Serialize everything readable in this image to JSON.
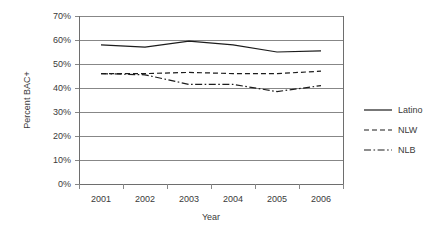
{
  "chart_data": {
    "type": "line",
    "title": "",
    "xlabel": "Year",
    "ylabel": "Percent BAC+",
    "categories": [
      "2001",
      "2002",
      "2003",
      "2004",
      "2005",
      "2006"
    ],
    "x": [
      2001,
      2002,
      2003,
      2004,
      2005,
      2006
    ],
    "ylim": [
      0,
      70
    ],
    "yticks": [
      0,
      10,
      20,
      30,
      40,
      50,
      60,
      70
    ],
    "ytick_labels": [
      "0%",
      "10%",
      "20%",
      "30%",
      "40%",
      "50%",
      "60%",
      "70%"
    ],
    "grid": "horizontal",
    "legend_position": "right",
    "series": [
      {
        "name": "Latino",
        "style": "solid",
        "values": [
          58,
          57,
          59.5,
          58,
          55,
          55.5
        ]
      },
      {
        "name": "NLW",
        "style": "dashed",
        "values": [
          46,
          46,
          46.5,
          46,
          46,
          47
        ]
      },
      {
        "name": "NLB",
        "style": "dash-dot",
        "values": [
          46,
          45.5,
          41.5,
          41.5,
          38.5,
          41
        ]
      }
    ]
  },
  "axes": {
    "y_title": "Percent BAC+",
    "x_title": "Year"
  },
  "legend": {
    "items": [
      {
        "label": "Latino",
        "style": "solid"
      },
      {
        "label": "NLW",
        "style": "dashed"
      },
      {
        "label": "NLB",
        "style": "dash-dot"
      }
    ]
  }
}
